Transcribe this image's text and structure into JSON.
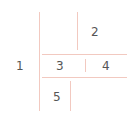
{
  "diagram": {
    "labels": {
      "one": "1",
      "two": "2",
      "three": "3",
      "four": "4",
      "five": "5"
    },
    "colors": {
      "line": "#f2c9c0",
      "text": "#555555",
      "background": "#ffffff"
    }
  }
}
